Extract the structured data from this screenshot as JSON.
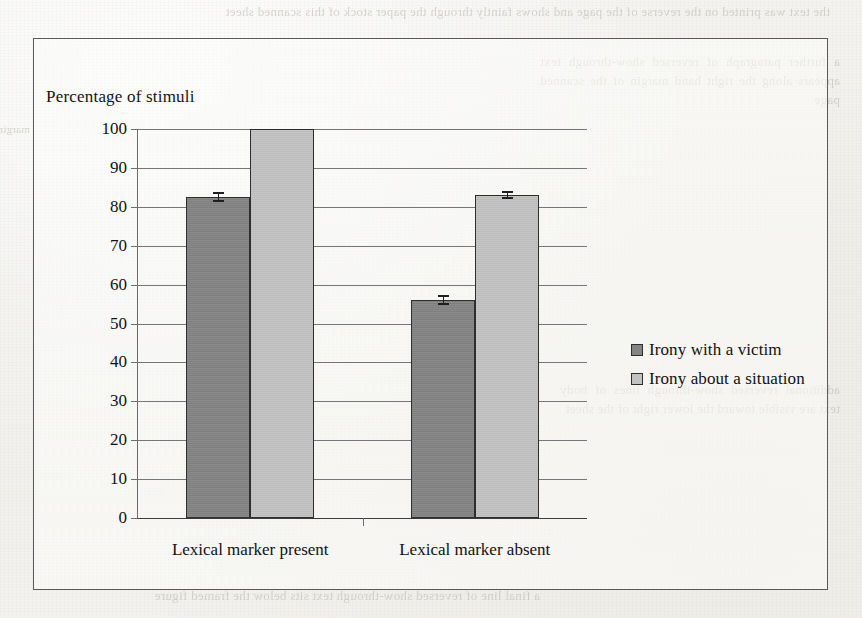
{
  "chart_data": {
    "type": "bar",
    "title": "Percentage of stimuli",
    "xlabel": "",
    "ylabel": "Percentage of stimuli",
    "categories": [
      "Lexical marker present",
      "Lexical marker absent"
    ],
    "series": [
      {
        "name": "Irony with a victim",
        "color": "#848484",
        "values": [
          82.5,
          56
        ],
        "errors": [
          1.2,
          1.2
        ]
      },
      {
        "name": "Irony about a situation",
        "color": "#c2c2c2",
        "values": [
          100,
          83
        ],
        "errors": [
          0,
          1.0
        ]
      }
    ],
    "ylim": [
      0,
      100
    ],
    "y_ticks": [
      0,
      10,
      20,
      30,
      40,
      50,
      60,
      70,
      80,
      90,
      100
    ],
    "y_tick_labels": [
      "0",
      "10",
      "20",
      "30",
      "40",
      "50",
      "60",
      "70",
      "80",
      "90",
      "100"
    ],
    "grid": true,
    "legend_position": "right",
    "frame": true
  },
  "legend": {
    "entries": [
      {
        "label": "Irony with a victim"
      },
      {
        "label": "Irony about a situation"
      }
    ]
  },
  "page_background": {
    "ghost_top": "the text was printed on the reverse of the page and shows faintly through the paper stock of this scanned sheet",
    "ghost_right": "a further paragraph of reversed show-through text appears along the right hand margin of the scanned page",
    "ghost_midr": "additional reversed show-through lines of body text are visible toward the lower right of the sheet",
    "ghost_bottom": "a final line of reversed show-through text sits below the framed figure",
    "ghost_left": "margin"
  },
  "colors": {
    "series_dark": "#848484",
    "series_light": "#c2c2c2",
    "frame": "#5a5a5a",
    "gridline": "#76757a",
    "text": "#121212"
  }
}
